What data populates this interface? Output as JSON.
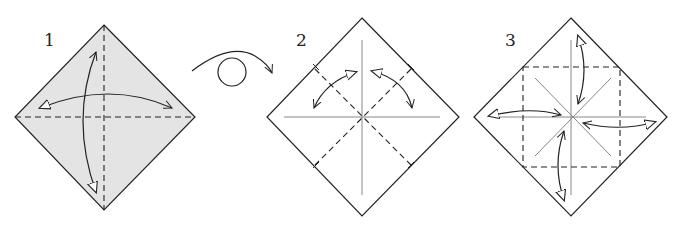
{
  "colors": {
    "paper_colored": "#e4e4e4",
    "paper_white": "#ffffff",
    "line": "#222222",
    "crease": "#888888"
  },
  "steps": [
    {
      "number": "1",
      "description": "Valley fold in half both ways and unfold (colored side up)"
    },
    {
      "number": "2",
      "description": "Turn over; valley fold diagonals and unfold"
    },
    {
      "number": "3",
      "description": "Fold corners to the center and unfold"
    }
  ],
  "turn_over_symbol": "turn-over-icon"
}
